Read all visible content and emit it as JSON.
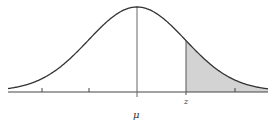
{
  "diagram": {
    "type": "normal-distribution-curve",
    "labels": {
      "mean": "μ",
      "z": "z"
    },
    "shaded_region": "right tail beyond z",
    "tick_count": 5,
    "colors": {
      "curve": "#333333",
      "axis": "#444444",
      "shade": "#d3d3d3",
      "background": "#ffffff"
    }
  },
  "chart_data": {
    "type": "area",
    "title": "",
    "xlabel": "",
    "ylabel": "",
    "distribution": "normal",
    "x_ticks_sigma": [
      -2,
      -1,
      0,
      1,
      2
    ],
    "tick_labels": [
      "",
      "",
      "μ",
      "z",
      ""
    ],
    "shaded": {
      "from_sigma": 1,
      "to_sigma": 2.7,
      "label": "z"
    },
    "grid": false
  }
}
